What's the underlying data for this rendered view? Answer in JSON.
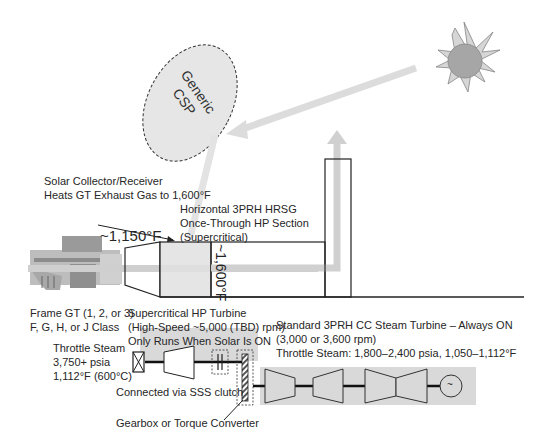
{
  "diagram": {
    "type": "process-schematic",
    "colors": {
      "shade": "#d9d9d9",
      "shade_light": "#e6e6e6",
      "line": "#222222",
      "sun_core": "#a6a6a6",
      "sun_rays": "#d0d0d0"
    },
    "csp": {
      "label_line1": "Generic",
      "label_line2": "CSP"
    },
    "solar_collector": {
      "line1": "Solar Collector/Receiver",
      "line2": "Heats GT Exhaust Gas to 1,600°F"
    },
    "hrsg": {
      "line1": "Horizontal 3PRH HRSG",
      "line2": "Once-Through HP Section",
      "line3": "(Supercritical)",
      "temp_inlet": "~1,150°F",
      "temp_after_receiver": "~1,600°F"
    },
    "gas_turbine": {
      "line1": "Frame GT (1, 2, or 3)",
      "line2": "F, G, H, or J Class"
    },
    "hp_turbine": {
      "line1": "Supercritical HP Turbine",
      "line2": "(High-Speed ~5,000 (TBD) rpm)",
      "line3": "Only Runs When Solar Is ON"
    },
    "throttle_steam_hp": {
      "line1": "Throttle Steam",
      "line2": "3,750+ psia",
      "line3": "1,112°F (600°C)"
    },
    "cc_steam_turbine": {
      "line1": "Standard 3PRH CC Steam Turbine – Always  ON",
      "line2": "(3,000 or 3,600 rpm)",
      "line3": "Throttle Steam: 1,800–2,400 psia, 1,050–1,112°F"
    },
    "clutch_label": "Connected via SSS clutch",
    "gearbox_label": "Gearbox or Torque Converter",
    "generator_symbol": "~"
  }
}
